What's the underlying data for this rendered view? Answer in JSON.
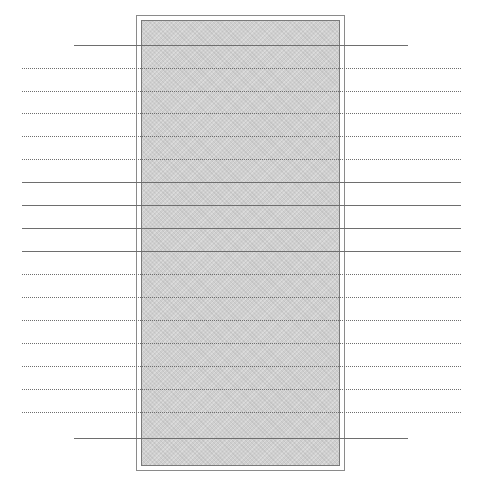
{
  "diagram": {
    "frame": {
      "left": 136,
      "top": 15,
      "right": 345,
      "bottom": 471
    },
    "fill": {
      "left": 141,
      "top": 20,
      "right": 340,
      "bottom": 466,
      "color": "#cfcfcf"
    },
    "line_color": "#6e6e6e",
    "lines": [
      {
        "y": 45,
        "style": "solid",
        "x1": 74,
        "x2": 408
      },
      {
        "y": 68,
        "style": "dotted",
        "x1": 22,
        "x2": 461
      },
      {
        "y": 91,
        "style": "dotted",
        "x1": 22,
        "x2": 461
      },
      {
        "y": 113,
        "style": "dotted",
        "x1": 22,
        "x2": 461
      },
      {
        "y": 136,
        "style": "dotted",
        "x1": 22,
        "x2": 461
      },
      {
        "y": 159,
        "style": "dotted",
        "x1": 22,
        "x2": 461
      },
      {
        "y": 182,
        "style": "solid",
        "x1": 22,
        "x2": 461
      },
      {
        "y": 205,
        "style": "solid",
        "x1": 22,
        "x2": 461
      },
      {
        "y": 228,
        "style": "solid",
        "x1": 22,
        "x2": 461
      },
      {
        "y": 251,
        "style": "solid",
        "x1": 22,
        "x2": 461
      },
      {
        "y": 274,
        "style": "dotted",
        "x1": 22,
        "x2": 461
      },
      {
        "y": 297,
        "style": "dotted",
        "x1": 22,
        "x2": 461
      },
      {
        "y": 320,
        "style": "dotted",
        "x1": 22,
        "x2": 461
      },
      {
        "y": 343,
        "style": "dotted",
        "x1": 22,
        "x2": 461
      },
      {
        "y": 366,
        "style": "dotted",
        "x1": 22,
        "x2": 461
      },
      {
        "y": 389,
        "style": "dotted",
        "x1": 22,
        "x2": 461
      },
      {
        "y": 412,
        "style": "dotted",
        "x1": 22,
        "x2": 461
      },
      {
        "y": 438,
        "style": "solid",
        "x1": 74,
        "x2": 408
      }
    ]
  }
}
